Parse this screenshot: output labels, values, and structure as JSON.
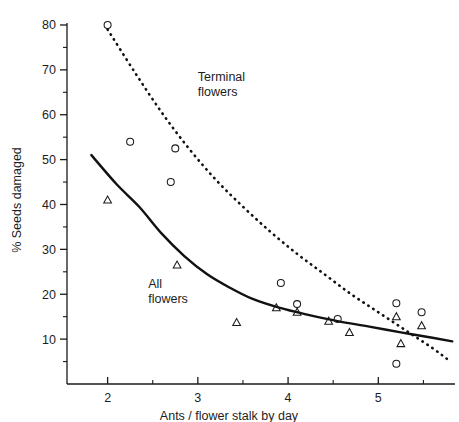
{
  "chart_data": {
    "type": "scatter",
    "title": "",
    "xlabel": "Ants / flower stalk by day",
    "ylabel": "% Seeds damaged",
    "xlim": [
      1.55,
      5.85
    ],
    "ylim": [
      0,
      82
    ],
    "grid": false,
    "legend_position": "inline-annotations",
    "x_major_ticks": [
      2,
      3,
      4,
      5
    ],
    "x_major_tick_labels": [
      "2",
      "3",
      "4",
      "5"
    ],
    "x_minor_ticks": [
      2.5,
      3.5,
      4.5,
      5.5
    ],
    "y_major_ticks": [
      10,
      20,
      30,
      40,
      50,
      60,
      70,
      80
    ],
    "y_major_tick_labels": [
      "10",
      "20",
      "30",
      "40",
      "50",
      "60",
      "70",
      "80"
    ],
    "y_minor_ticks": [
      5,
      15,
      25,
      35,
      45,
      55,
      65,
      75
    ],
    "annotations": [
      {
        "text_line1": "Terminal",
        "text_line2": "flowers",
        "x": 3.0,
        "y": 67.5,
        "series": "terminal-flowers"
      },
      {
        "text_line1": "All",
        "text_line2": "flowers",
        "x": 2.45,
        "y": 21.5,
        "series": "all-flowers"
      }
    ],
    "series": [
      {
        "name": "Terminal flowers",
        "marker": "open-circle",
        "curve_style": "dotted",
        "points": [
          {
            "x": 2.0,
            "y": 80.0
          },
          {
            "x": 2.25,
            "y": 54.0
          },
          {
            "x": 2.75,
            "y": 52.5
          },
          {
            "x": 2.7,
            "y": 45.0
          },
          {
            "x": 3.92,
            "y": 22.5
          },
          {
            "x": 4.1,
            "y": 17.8
          },
          {
            "x": 4.55,
            "y": 14.5
          },
          {
            "x": 5.2,
            "y": 18.0
          },
          {
            "x": 5.48,
            "y": 16.0
          },
          {
            "x": 5.2,
            "y": 4.5
          }
        ],
        "fit_curve": [
          {
            "x": 2.0,
            "y": 79.0
          },
          {
            "x": 2.3,
            "y": 69.5
          },
          {
            "x": 2.6,
            "y": 60.5
          },
          {
            "x": 2.9,
            "y": 52.5
          },
          {
            "x": 3.2,
            "y": 45.5
          },
          {
            "x": 3.5,
            "y": 39.5
          },
          {
            "x": 3.8,
            "y": 34.0
          },
          {
            "x": 4.1,
            "y": 29.0
          },
          {
            "x": 4.4,
            "y": 24.5
          },
          {
            "x": 4.7,
            "y": 20.0
          },
          {
            "x": 5.0,
            "y": 16.0
          },
          {
            "x": 5.3,
            "y": 12.0
          },
          {
            "x": 5.6,
            "y": 8.0
          },
          {
            "x": 5.8,
            "y": 5.0
          }
        ]
      },
      {
        "name": "All flowers",
        "marker": "open-triangle",
        "curve_style": "solid",
        "points": [
          {
            "x": 2.0,
            "y": 41.0
          },
          {
            "x": 2.77,
            "y": 26.5
          },
          {
            "x": 3.43,
            "y": 13.7
          },
          {
            "x": 3.87,
            "y": 17.0
          },
          {
            "x": 4.1,
            "y": 16.0
          },
          {
            "x": 4.45,
            "y": 14.0
          },
          {
            "x": 4.68,
            "y": 11.5
          },
          {
            "x": 5.2,
            "y": 15.0
          },
          {
            "x": 5.48,
            "y": 13.0
          },
          {
            "x": 5.25,
            "y": 9.0
          }
        ],
        "fit_curve": [
          {
            "x": 1.82,
            "y": 51.0
          },
          {
            "x": 2.1,
            "y": 44.5
          },
          {
            "x": 2.35,
            "y": 39.5
          },
          {
            "x": 2.6,
            "y": 33.5
          },
          {
            "x": 2.85,
            "y": 28.5
          },
          {
            "x": 3.1,
            "y": 24.5
          },
          {
            "x": 3.35,
            "y": 21.5
          },
          {
            "x": 3.6,
            "y": 19.0
          },
          {
            "x": 3.9,
            "y": 17.0
          },
          {
            "x": 4.2,
            "y": 15.5
          },
          {
            "x": 4.55,
            "y": 14.0
          },
          {
            "x": 4.9,
            "y": 12.8
          },
          {
            "x": 5.25,
            "y": 11.5
          },
          {
            "x": 5.6,
            "y": 10.3
          },
          {
            "x": 5.82,
            "y": 9.5
          }
        ]
      }
    ]
  }
}
